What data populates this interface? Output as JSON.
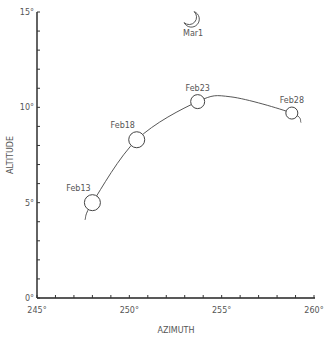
{
  "chart_data": {
    "type": "scatter",
    "title": "",
    "xlabel": "AZIMUTH",
    "ylabel": "ALTITUDE",
    "xlim": [
      245,
      260
    ],
    "ylim": [
      0,
      15
    ],
    "x_ticks": [
      "245°",
      "250°",
      "255°",
      "260°"
    ],
    "y_ticks": [
      "0°",
      "5°",
      "10°",
      "15°"
    ],
    "grid": false,
    "series": [
      {
        "name": "Moon positions",
        "points": [
          {
            "label": "Feb13",
            "x": 248.0,
            "y": 5.0
          },
          {
            "label": "Feb18",
            "x": 250.4,
            "y": 8.3
          },
          {
            "label": "Feb23",
            "x": 253.7,
            "y": 10.3
          },
          {
            "label": "Feb28",
            "x": 258.8,
            "y": 9.7
          }
        ]
      },
      {
        "name": "Crescent",
        "points": [
          {
            "label": "Mar1",
            "x": 253.4,
            "y": 14.6
          }
        ]
      }
    ],
    "curve": "fitted arc through points from ~247.6,4.1 to ~259.3,9.2"
  }
}
